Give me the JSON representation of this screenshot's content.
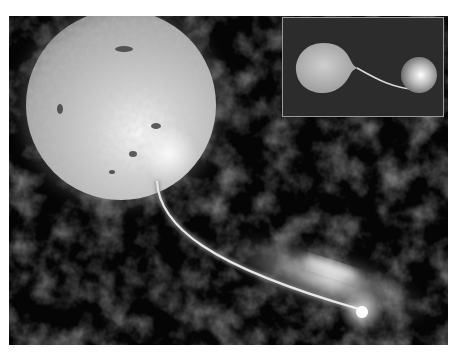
{
  "image": {
    "subject": "binary-star-accretion-illustration",
    "elements": [
      {
        "name": "giant-star",
        "description": "large textured grey star with dark spots"
      },
      {
        "name": "mass-transfer-stream",
        "description": "bright stream flowing from giant star to companion"
      },
      {
        "name": "accretion-disk",
        "description": "glowing elliptical disk around compact companion"
      },
      {
        "name": "compact-companion",
        "description": "bright point at end of stream"
      },
      {
        "name": "inset-roche-lobe-view",
        "description": "inset showing teardrop-shaped star transferring mass to spherical companion"
      }
    ],
    "colors": {
      "background": "#050505",
      "nebula": "#2a2a2a",
      "star": "#bdbdbd",
      "inset_bg": "#2c2c2c",
      "inset_border": "#9a9a9a"
    }
  }
}
